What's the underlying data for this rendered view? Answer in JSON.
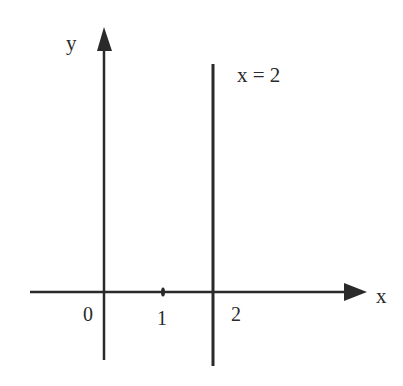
{
  "diagram": {
    "colors": {
      "ink": "#2a2a2a",
      "background": "#ffffff"
    },
    "axes": {
      "x_label": "x",
      "y_label": "y"
    },
    "tick_labels": [
      "0",
      "1",
      "2"
    ],
    "line": {
      "equation_label": "x = 2",
      "equation": "x = 2",
      "orientation": "vertical"
    }
  }
}
